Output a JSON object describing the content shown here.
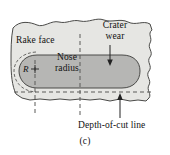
{
  "figure": {
    "caption": "(c)",
    "labels": {
      "rake_face": "Rake face",
      "crater_wear_line1": "Crater",
      "crater_wear_line2": "wear",
      "nose_radius_line1": "Nose",
      "nose_radius_line2": "radius",
      "radius_symbol": "R",
      "depth_of_cut_line": "Depth-of-cut line"
    },
    "colors": {
      "tool_body_fill": "#e6e6e3",
      "crater_fill": "#b6b6b4",
      "outline": "#4a4a48",
      "dashed_line": "#5a5a58",
      "text": "#111111",
      "background": "#ffffff"
    },
    "annotations": [
      {
        "name": "crater-wear-arrow",
        "direction": "down",
        "target": "crater-region"
      },
      {
        "name": "depth-of-cut-arrow",
        "direction": "up",
        "target": "tool-bottom-edge"
      },
      {
        "name": "nose-radius-center-marker",
        "glyph": "cross"
      }
    ],
    "dashed_guides": [
      {
        "name": "nose-radius-vertical-guide",
        "orientation": "vertical"
      },
      {
        "name": "mid-vertical-guide",
        "orientation": "vertical"
      },
      {
        "name": "depth-of-cut-horizontal-guide",
        "orientation": "horizontal"
      }
    ]
  }
}
